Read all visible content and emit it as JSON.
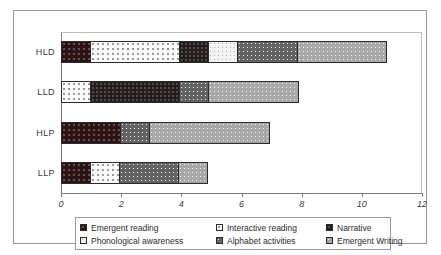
{
  "chart_data": {
    "type": "bar",
    "orientation": "horizontal",
    "stacked": true,
    "title": "",
    "xlabel": "",
    "ylabel": "",
    "categories": [
      "HLD",
      "LLD",
      "HLP",
      "LLP"
    ],
    "xlim": [
      0,
      12
    ],
    "xticks": [
      0,
      2,
      4,
      6,
      8,
      10,
      12
    ],
    "grid": false,
    "legend_position": "bottom",
    "series": [
      {
        "name": "Emergent reading",
        "values": [
          1,
          0,
          2,
          1
        ]
      },
      {
        "name": "Interactive reading",
        "values": [
          3,
          1,
          0,
          1
        ]
      },
      {
        "name": "Narrative",
        "values": [
          1,
          3,
          0,
          0
        ]
      },
      {
        "name": "Phonological awareness",
        "values": [
          1,
          0,
          0,
          0
        ]
      },
      {
        "name": "Alphabet activities",
        "values": [
          2,
          1,
          1,
          2
        ]
      },
      {
        "name": "Emergent Writing",
        "values": [
          3,
          3,
          4,
          1
        ]
      }
    ],
    "totals": [
      11,
      8,
      7,
      5
    ]
  },
  "legend": {
    "items": [
      {
        "label": "Emergent reading"
      },
      {
        "label": "Interactive reading"
      },
      {
        "label": "Narrative"
      },
      {
        "label": "Phonological awareness"
      },
      {
        "label": "Alphabet activities"
      },
      {
        "label": "Emergent Writing"
      }
    ]
  }
}
